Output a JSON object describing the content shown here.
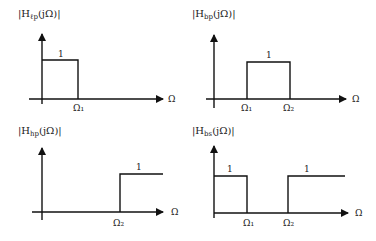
{
  "figure": {
    "panels": [
      {
        "id": "lowpass",
        "title_prefix": "|H",
        "title_sub": "ℓp",
        "title_suffix": "(jΩ)|",
        "axis_label": "Ω",
        "level_label": "1",
        "ticks": [
          "Ω₁"
        ]
      },
      {
        "id": "bandpass",
        "title_prefix": "|H",
        "title_sub": "bp",
        "title_suffix": "(jΩ)|",
        "axis_label": "Ω",
        "level_label": "1",
        "ticks": [
          "Ω₁",
          "Ω₂"
        ]
      },
      {
        "id": "highpass",
        "title_prefix": "|H",
        "title_sub": "hp",
        "title_suffix": "(jΩ)|",
        "axis_label": "Ω",
        "level_label": "1",
        "ticks": [
          "Ω₂"
        ]
      },
      {
        "id": "bandstop",
        "title_prefix": "|H",
        "title_sub": "bs",
        "title_suffix": "(jΩ)|",
        "axis_label": "Ω",
        "level_labels": [
          "1",
          "1"
        ],
        "ticks": [
          "Ω₁",
          "Ω₂"
        ]
      }
    ]
  }
}
